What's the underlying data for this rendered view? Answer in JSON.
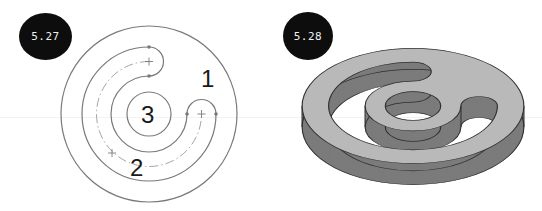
{
  "figures": [
    {
      "id_label": "5.27",
      "kind": "plan-view sketch",
      "region_labels": [
        "1",
        "2",
        "3"
      ],
      "line_color": "#7a7a7a"
    },
    {
      "id_label": "5.28",
      "kind": "3D extruded part",
      "top_face_color": "#b9b9b9",
      "side_face_color": "#7b7b7b",
      "edge_color": "#2e2e2e"
    }
  ]
}
